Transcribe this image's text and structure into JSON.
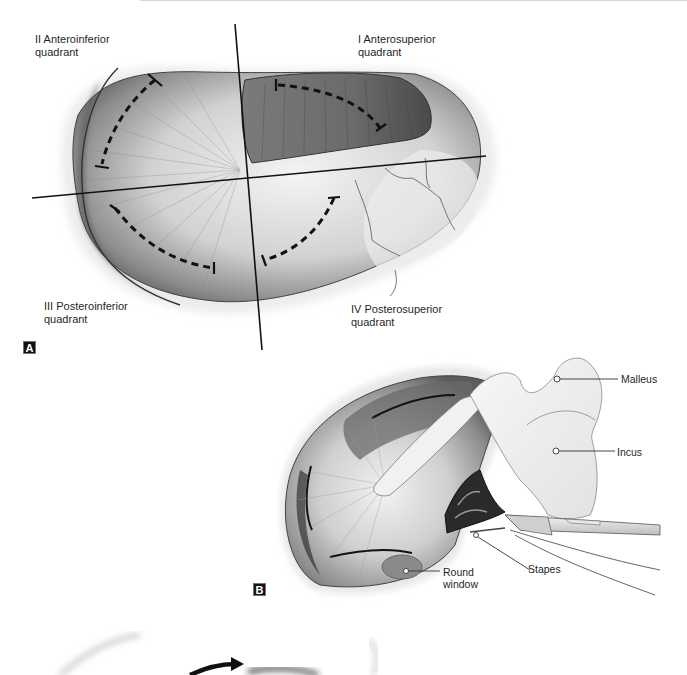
{
  "figure": {
    "panel_a": {
      "letter": "A",
      "quadrants": [
        {
          "id": "II",
          "label_line1": "II Anteroinferior",
          "label_line2": "quadrant"
        },
        {
          "id": "I",
          "label_line1": "I Anterosuperior",
          "label_line2": "quadrant"
        },
        {
          "id": "III",
          "label_line1": "III Posteroinferior",
          "label_line2": "quadrant"
        },
        {
          "id": "IV",
          "label_line1": "IV Posterosuperior",
          "label_line2": "quadrant"
        }
      ]
    },
    "panel_b": {
      "letter": "B",
      "callouts": [
        {
          "name": "malleus",
          "label": "Malleus"
        },
        {
          "name": "incus",
          "label": "Incus"
        },
        {
          "name": "stapes",
          "label": "Stapes"
        },
        {
          "name": "round-window",
          "label_line1": "Round",
          "label_line2": "window"
        }
      ]
    },
    "colors": {
      "ink": "#111111",
      "membrane_dark": "#5a5a5a",
      "membrane_mid": "#9a9a9a",
      "membrane_light": "#dcdcdc",
      "background": "#ffffff"
    }
  }
}
